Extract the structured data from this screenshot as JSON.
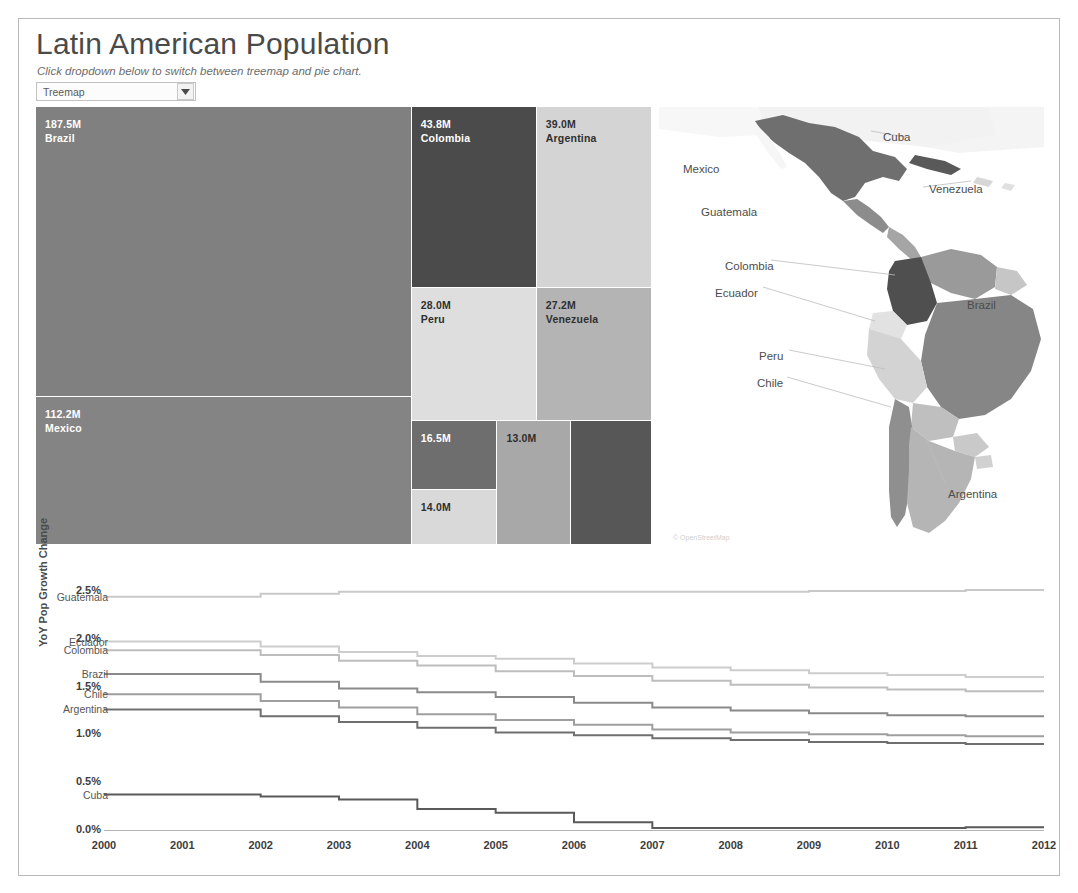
{
  "header": {
    "title": "Latin American Population",
    "subtitle": "Click dropdown below to switch between treemap and pie chart.",
    "dropdown": {
      "name": "chart-type-select",
      "value": "Treemap",
      "options": [
        "Treemap",
        "Pie Chart"
      ],
      "arrow_icon": "chevron-down-icon"
    }
  },
  "treemap": {
    "title": "Treemap of Latin American Population",
    "cells": [
      {
        "label": "Brazil",
        "value_text": "187.5M",
        "value": 187.5,
        "color": "#808080",
        "text_tone": "light",
        "x": 0,
        "y": 0,
        "w": 61.0,
        "h": 66.2
      },
      {
        "label": "Mexico",
        "value_text": "112.2M",
        "value": 112.2,
        "color": "#848484",
        "text_tone": "light",
        "x": 0,
        "y": 66.2,
        "w": 61.0,
        "h": 33.8
      },
      {
        "label": "Colombia",
        "value_text": "43.8M",
        "value": 43.8,
        "color": "#4b4b4b",
        "text_tone": "light",
        "x": 61.0,
        "y": 0,
        "w": 20.3,
        "h": 41.3
      },
      {
        "label": "Argentina",
        "value_text": "39.0M",
        "value": 39.0,
        "color": "#d4d4d4",
        "text_tone": "dark",
        "x": 81.3,
        "y": 0,
        "w": 18.7,
        "h": 41.3
      },
      {
        "label": "Peru",
        "value_text": "28.0M",
        "value": 28.0,
        "color": "#dedede",
        "text_tone": "dark",
        "x": 61.0,
        "y": 41.3,
        "w": 20.3,
        "h": 30.5
      },
      {
        "label": "Venezuela",
        "value_text": "27.2M",
        "value": 27.2,
        "color": "#b4b4b4",
        "text_tone": "dark",
        "x": 81.3,
        "y": 41.3,
        "w": 18.7,
        "h": 30.5
      },
      {
        "label": "",
        "value_text": "16.5M",
        "value": 16.5,
        "color": "#6e6e6e",
        "text_tone": "light",
        "x": 61.0,
        "y": 71.8,
        "w": 13.9,
        "h": 15.6
      },
      {
        "label": "",
        "value_text": "14.0M",
        "value": 14.0,
        "color": "#d9d9d9",
        "text_tone": "dark",
        "x": 61.0,
        "y": 87.4,
        "w": 13.9,
        "h": 12.6
      },
      {
        "label": "",
        "value_text": "13.0M",
        "value": 13.0,
        "color": "#a8a8a8",
        "text_tone": "dark",
        "x": 74.9,
        "y": 71.8,
        "w": 12.0,
        "h": 28.2
      },
      {
        "label": "",
        "value_text": "",
        "value": 11.0,
        "color": "#575757",
        "text_tone": "light",
        "x": 86.9,
        "y": 71.8,
        "w": 13.1,
        "h": 28.2
      }
    ]
  },
  "map": {
    "attribution": "© OpenStreetMap",
    "labels": [
      {
        "name": "Mexico",
        "x": 24,
        "y": 56
      },
      {
        "name": "Cuba",
        "x": 224,
        "y": 24
      },
      {
        "name": "Guatemala",
        "x": 42,
        "y": 99
      },
      {
        "name": "Venezuela",
        "x": 270,
        "y": 76
      },
      {
        "name": "Colombia",
        "x": 66,
        "y": 153
      },
      {
        "name": "Ecuador",
        "x": 56,
        "y": 180
      },
      {
        "name": "Brazil",
        "x": 308,
        "y": 192
      },
      {
        "name": "Peru",
        "x": 100,
        "y": 243
      },
      {
        "name": "Chile",
        "x": 98,
        "y": 270
      },
      {
        "name": "Argentina",
        "x": 289,
        "y": 381
      }
    ]
  },
  "chart_data": {
    "type": "line",
    "xlabel": "",
    "ylabel": "YoY Pop Growth Change",
    "x": [
      2000,
      2001,
      2002,
      2003,
      2004,
      2005,
      2006,
      2007,
      2008,
      2009,
      2010,
      2011,
      2012
    ],
    "xticks": [
      "2000",
      "2001",
      "2002",
      "2003",
      "2004",
      "2005",
      "2006",
      "2007",
      "2008",
      "2009",
      "2010",
      "2011",
      "2012"
    ],
    "yticks": [
      "0.0%",
      "0.5%",
      "1.0%",
      "1.5%",
      "2.0%",
      "2.5%"
    ],
    "ylim": [
      0.0,
      2.75
    ],
    "grid": false,
    "legend_position": "inline-left",
    "series": [
      {
        "name": "Guatemala",
        "color": "#c9c9c9",
        "values": [
          2.44,
          2.44,
          2.47,
          2.49,
          2.49,
          2.49,
          2.49,
          2.49,
          2.49,
          2.5,
          2.5,
          2.51,
          2.51
        ]
      },
      {
        "name": "Ecuador",
        "color": "#cdcdcd",
        "values": [
          1.97,
          1.97,
          1.92,
          1.86,
          1.82,
          1.79,
          1.74,
          1.7,
          1.67,
          1.64,
          1.62,
          1.6,
          1.6
        ]
      },
      {
        "name": "Colombia",
        "color": "#bdbdbd",
        "values": [
          1.88,
          1.88,
          1.83,
          1.77,
          1.72,
          1.66,
          1.61,
          1.56,
          1.52,
          1.49,
          1.47,
          1.45,
          1.45
        ]
      },
      {
        "name": "Brazil",
        "color": "#8a8a8a",
        "values": [
          1.63,
          1.63,
          1.55,
          1.48,
          1.44,
          1.39,
          1.33,
          1.28,
          1.25,
          1.22,
          1.2,
          1.19,
          1.19
        ]
      },
      {
        "name": "Chile",
        "color": "#9e9e9e",
        "values": [
          1.42,
          1.42,
          1.35,
          1.28,
          1.21,
          1.15,
          1.1,
          1.05,
          1.02,
          1.0,
          0.99,
          0.98,
          0.98
        ]
      },
      {
        "name": "Argentina",
        "color": "#6f6f6f",
        "values": [
          1.26,
          1.26,
          1.19,
          1.13,
          1.07,
          1.02,
          0.99,
          0.96,
          0.94,
          0.92,
          0.91,
          0.9,
          0.9
        ]
      },
      {
        "name": "Cuba",
        "color": "#5a5a5a",
        "values": [
          0.37,
          0.37,
          0.35,
          0.32,
          0.22,
          0.18,
          0.08,
          0.02,
          0.02,
          0.02,
          0.02,
          0.03,
          0.03
        ]
      }
    ],
    "label_positions": [
      {
        "name": "Guatemala",
        "value": 2.44
      },
      {
        "name": "Ecuador",
        "value": 1.97
      },
      {
        "name": "Colombia",
        "value": 1.88
      },
      {
        "name": "Brazil",
        "value": 1.63
      },
      {
        "name": "Chile",
        "value": 1.42
      },
      {
        "name": "Argentina",
        "value": 1.26
      },
      {
        "name": "Cuba",
        "value": 0.37
      }
    ]
  }
}
